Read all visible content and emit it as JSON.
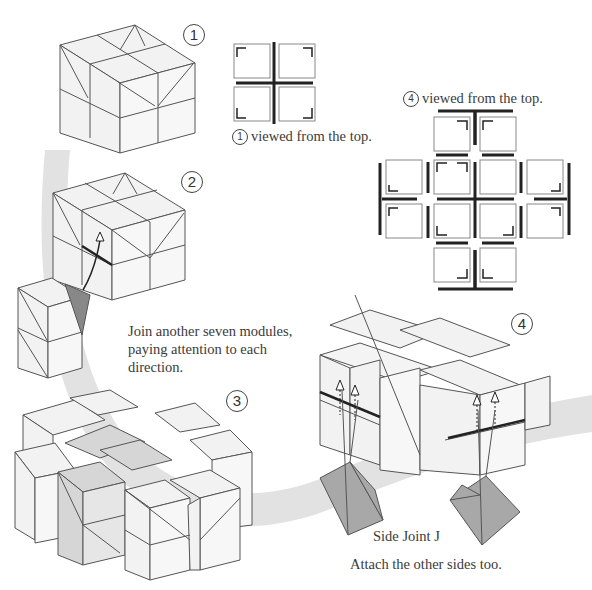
{
  "steps": [
    {
      "id": 1,
      "label": "1"
    },
    {
      "id": 2,
      "label": "2"
    },
    {
      "id": 3,
      "label": "3"
    },
    {
      "id": 4,
      "label": "4"
    }
  ],
  "captions": {
    "top_view_1": {
      "step": "1",
      "text": "viewed from the top."
    },
    "top_view_4": {
      "step": "4",
      "text": "viewed from the top."
    },
    "instruction_join": [
      "Join another seven modules,",
      "paying attention to each",
      "direction."
    ],
    "side_joint_label": "Side Joint J",
    "instruction_attach": "Attach the other sides too."
  },
  "colors": {
    "module_face": "#f0f0f0",
    "module_face_dark": "#d6d6d6",
    "edge": "#555555",
    "flow_band": "#e2e2e2",
    "joint_fill": "#a8a8a8",
    "bold_line": "#222222"
  }
}
